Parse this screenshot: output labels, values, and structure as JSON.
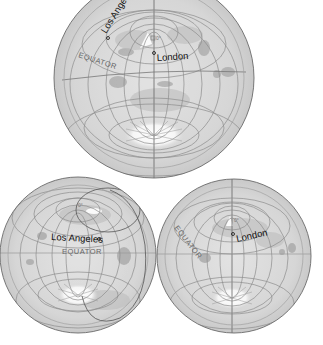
{
  "figure": {
    "colors": {
      "background": "#ffffff",
      "ocean": "#dcdcdc",
      "globe_edge": "#6a6a6a",
      "graticule": "#8a8a8a",
      "land_dark": "#9a9a9a",
      "ice": "#ffffff",
      "label_text": "#111111",
      "equator_text": "#666666"
    }
  },
  "globes": [
    {
      "id": "top",
      "center_label": "0°",
      "cities": [
        {
          "name": "Los Angeles",
          "label": "Los Angeles"
        },
        {
          "name": "London",
          "label": "London"
        }
      ],
      "equator_label": "EQUATOR"
    },
    {
      "id": "bottom-left",
      "center_label": "0°",
      "cities": [
        {
          "name": "Los Angeles",
          "label": "Los Angeles"
        }
      ],
      "equator_label": "EQUATOR"
    },
    {
      "id": "bottom-right",
      "center_label": "0°",
      "cities": [
        {
          "name": "London",
          "label": "London"
        }
      ],
      "equator_label": "EQUATOR"
    }
  ]
}
